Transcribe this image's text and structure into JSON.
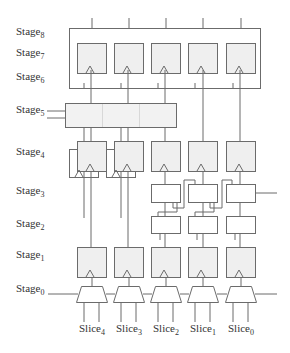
{
  "stages": [
    {
      "base": "Stage",
      "sub": "8",
      "y": 32
    },
    {
      "base": "Stage",
      "sub": "7",
      "y": 53
    },
    {
      "base": "Stage",
      "sub": "6",
      "y": 77
    },
    {
      "base": "Stage",
      "sub": "5",
      "y": 110
    },
    {
      "base": "Stage",
      "sub": "4",
      "y": 152
    },
    {
      "base": "Stage",
      "sub": "3",
      "y": 191
    },
    {
      "base": "Stage",
      "sub": "2",
      "y": 224
    },
    {
      "base": "Stage",
      "sub": "1",
      "y": 255
    },
    {
      "base": "Stage",
      "sub": "0",
      "y": 289
    }
  ],
  "slices": [
    {
      "base": "Slice",
      "sub": "4"
    },
    {
      "base": "Slice",
      "sub": "3"
    },
    {
      "base": "Slice",
      "sub": "2"
    },
    {
      "base": "Slice",
      "sub": "1"
    },
    {
      "base": "Slice",
      "sub": "0"
    }
  ],
  "colors": {
    "stroke": "#6b6b6b",
    "register_fill": "#efefef",
    "logic_fill": "#ffffff",
    "text": "#333333"
  }
}
